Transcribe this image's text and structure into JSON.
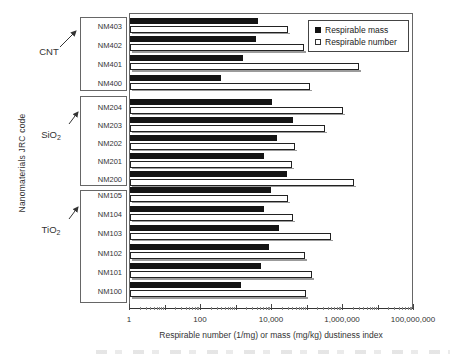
{
  "figure": {
    "y_axis_title": "Nanomaterials JRC code",
    "x_axis_title": "Respirable number (1/mg) or mass (mg/kg) dustiness index"
  },
  "chart_data": {
    "type": "bar",
    "orientation": "horizontal",
    "x_scale": "log",
    "x_range": [
      1,
      100000000
    ],
    "grid": false,
    "legend_position": "top-right-inside",
    "x_ticks": [
      {
        "label": "1",
        "value": 1
      },
      {
        "label": "100",
        "value": 100
      },
      {
        "label": "10,000",
        "value": 10000
      },
      {
        "label": "1,000,000",
        "value": 1000000
      },
      {
        "label": "100,000,000",
        "value": 100000000
      }
    ],
    "series": [
      {
        "name": "Respirable mass",
        "style": "filled-black"
      },
      {
        "name": "Respirable number",
        "style": "open-white"
      }
    ],
    "groups": [
      {
        "name": "CNT",
        "name_sub": "",
        "categories": [
          "NM403",
          "NM402",
          "NM401",
          "NM400"
        ],
        "respirable_mass": [
          4000,
          3600,
          1500,
          360
        ],
        "respirable_number": [
          28000,
          80000,
          2800000,
          120000
        ]
      },
      {
        "name": "SiO",
        "name_sub": "2",
        "categories": [
          "NM204",
          "NM203",
          "NM202",
          "NM201",
          "NM200"
        ],
        "respirable_mass": [
          10000,
          38000,
          14000,
          5800,
          27000
        ],
        "respirable_number": [
          1000000,
          310000,
          43000,
          36000,
          2100000
        ]
      },
      {
        "name": "TiO",
        "name_sub": "2",
        "categories": [
          "NM105",
          "NM104",
          "NM103",
          "NM102",
          "NM101",
          "NM100"
        ],
        "respirable_mass": [
          9500,
          5800,
          16000,
          8000,
          4800,
          1300
        ],
        "respirable_number": [
          29000,
          38000,
          460000,
          85000,
          135000,
          92000
        ]
      }
    ]
  },
  "colors": {
    "bar_mass": "#141414",
    "bar_number_fill": "#ffffff",
    "bar_border": "#222222",
    "bar_shadow": "#9b9b9b",
    "axis": "#444444",
    "text": "#333333"
  }
}
